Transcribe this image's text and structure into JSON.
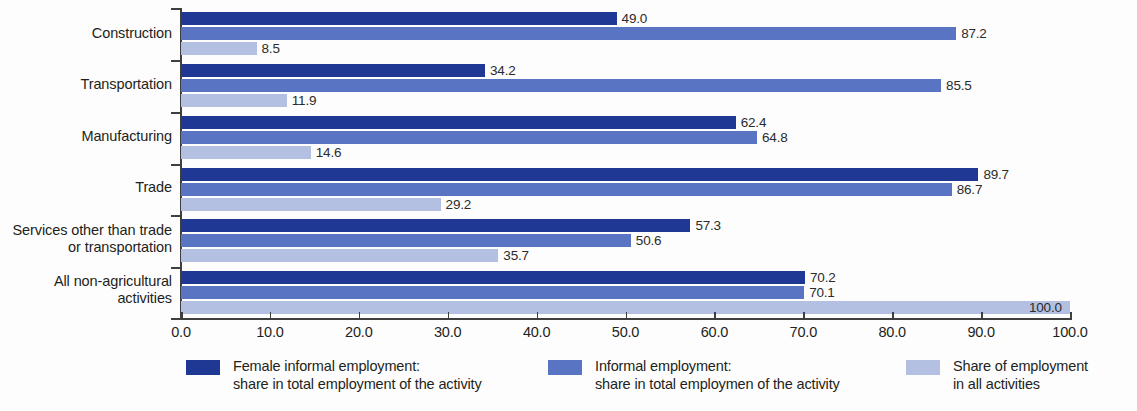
{
  "chart_data": {
    "type": "bar",
    "orientation": "horizontal",
    "title": "",
    "subtitle": "",
    "xlabel": "",
    "ylabel": "",
    "xlim": [
      0.0,
      100.0
    ],
    "xticks": [
      "0.0",
      "10.0",
      "20.0",
      "30.0",
      "40.0",
      "50.0",
      "60.0",
      "70.0",
      "80.0",
      "90.0",
      "100.0"
    ],
    "xtick_values": [
      0,
      10,
      20,
      30,
      40,
      50,
      60,
      70,
      80,
      90,
      100
    ],
    "grid": false,
    "legend_position": "bottom",
    "categories": [
      "Construction",
      "Transportation",
      "Manufacturing",
      "Trade",
      "Services other than trade or transportation",
      "All non-agricultural activities"
    ],
    "category_label_lines": [
      [
        "Construction"
      ],
      [
        "Transportation"
      ],
      [
        "Manufacturing"
      ],
      [
        "Trade"
      ],
      [
        "Services other than trade",
        "or transportation"
      ],
      [
        "All non-agricultural",
        "activities"
      ]
    ],
    "series": [
      {
        "name": "Female informal employment: share in total employment of the activity",
        "color": "#1f3893",
        "values": [
          49.0,
          34.2,
          62.4,
          89.7,
          57.3,
          70.2
        ],
        "labels": [
          "49.0",
          "34.2",
          "62.4",
          "89.7",
          "57.3",
          "70.2"
        ]
      },
      {
        "name": "Informal employment: share in total employmen of the activity",
        "color": "#5a74c4",
        "values": [
          87.2,
          85.5,
          64.8,
          86.7,
          50.6,
          70.1
        ],
        "labels": [
          "87.2",
          "85.5",
          "64.8",
          "86.7",
          "50.6",
          "70.1"
        ]
      },
      {
        "name": "Share of employment in all activities",
        "color": "#b3c0e2",
        "values": [
          8.5,
          11.9,
          14.6,
          29.2,
          35.7,
          100.0
        ],
        "labels": [
          "8.5",
          "11.9",
          "14.6",
          "29.2",
          "35.7",
          "100.0"
        ]
      }
    ]
  },
  "legend": {
    "items": [
      {
        "color": "#1f3893",
        "line1": "Female informal employment:",
        "line2": "share in total employment of the activity"
      },
      {
        "color": "#5a74c4",
        "line1": "Informal employment:",
        "line2": "share in total employmen of the activity"
      },
      {
        "color": "#b3c0e2",
        "line1": "Share of employment",
        "line2": "in all activities"
      }
    ]
  }
}
